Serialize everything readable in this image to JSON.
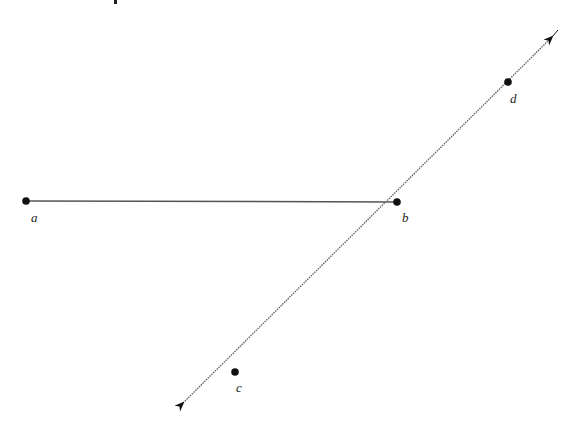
{
  "diagram": {
    "type": "geometry",
    "colors": {
      "line": "#555555",
      "point": "#111111",
      "label": "#222222",
      "background": "#ffffff"
    },
    "points": [
      {
        "id": "a",
        "label": "a",
        "x": 26,
        "y": 201,
        "label_x": 31,
        "label_y": 222
      },
      {
        "id": "b",
        "label": "b",
        "x": 397,
        "y": 202,
        "label_x": 402,
        "label_y": 222
      },
      {
        "id": "c",
        "label": "c",
        "x": 235,
        "y": 372,
        "label_x": 236,
        "label_y": 392
      },
      {
        "id": "d",
        "label": "d",
        "x": 508,
        "y": 82,
        "label_x": 510,
        "label_y": 103
      }
    ],
    "segments": [
      {
        "id": "segment-ab",
        "from": "a",
        "to": "b",
        "style": "solid"
      }
    ],
    "lines": [
      {
        "id": "line-cd",
        "through": [
          "c",
          "d"
        ],
        "style": "dotted",
        "arrow_start": {
          "x": 177,
          "y": 410
        },
        "arrow_end": {
          "x": 558,
          "y": 30
        }
      }
    ],
    "partial_top_mark": {
      "x": 115,
      "y": 0
    }
  }
}
